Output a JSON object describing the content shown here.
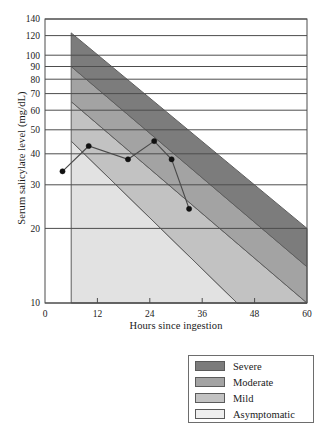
{
  "chart_data": {
    "type": "area",
    "title": "",
    "xlabel": "Hours since ingestion",
    "ylabel": "Serum salicylate level  (mg/dL)",
    "xlim": [
      0,
      60
    ],
    "ylim": [
      10,
      140
    ],
    "y_scale": "log",
    "grid": true,
    "xticks": [
      0,
      12,
      24,
      36,
      48,
      60
    ],
    "xtick_labels": [
      "0",
      "12",
      "24",
      "36",
      "48",
      "60"
    ],
    "yticks": [
      10,
      20,
      30,
      40,
      50,
      60,
      70,
      80,
      90,
      100,
      120,
      140
    ],
    "ytick_labels": [
      "10",
      "20",
      "30",
      "40",
      "50",
      "60",
      "70",
      "80",
      "90",
      "100",
      "120",
      "140"
    ],
    "legend_position": "below-right",
    "bands": [
      {
        "name": "Severe",
        "color": "#7c7c7c",
        "upper_boundary": [
          [
            6,
            123
          ],
          [
            60,
            20
          ]
        ],
        "lower_boundary": [
          [
            6,
            90
          ],
          [
            60,
            14
          ]
        ]
      },
      {
        "name": "Moderate",
        "color": "#a3a3a3",
        "upper_boundary": [
          [
            6,
            90
          ],
          [
            60,
            14
          ]
        ],
        "lower_boundary": [
          [
            6,
            65
          ],
          [
            60,
            10
          ]
        ]
      },
      {
        "name": "Mild",
        "color": "#c2c2c2",
        "upper_boundary": [
          [
            6,
            65
          ],
          [
            60,
            10
          ]
        ],
        "lower_boundary": [
          [
            6,
            45
          ],
          [
            44,
            10
          ]
        ]
      },
      {
        "name": "Asymptomatic",
        "color": "#e2e2e2",
        "upper_boundary": [
          [
            6,
            45
          ],
          [
            44,
            10
          ]
        ],
        "lower_boundary": [
          [
            6,
            10
          ],
          [
            60,
            10
          ]
        ]
      }
    ],
    "series": [
      {
        "name": "Patient serum salicylate",
        "marker": "filled-circle",
        "line_color": "#4a4a4a",
        "points": [
          {
            "x": 4,
            "y": 34
          },
          {
            "x": 10,
            "y": 43
          },
          {
            "x": 19,
            "y": 38
          },
          {
            "x": 25,
            "y": 45
          },
          {
            "x": 29,
            "y": 38
          },
          {
            "x": 33,
            "y": 24
          }
        ]
      }
    ]
  },
  "legend": {
    "items": [
      {
        "label": "Severe",
        "color": "#7c7c7c"
      },
      {
        "label": "Moderate",
        "color": "#a3a3a3"
      },
      {
        "label": "Mild",
        "color": "#c2c2c2"
      },
      {
        "label": "Asymptomatic",
        "color": "#eeeeee"
      }
    ]
  }
}
